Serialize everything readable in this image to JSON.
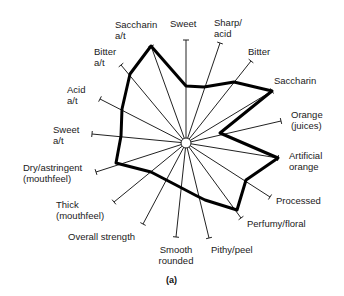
{
  "caption": "(a)",
  "chart_data": {
    "type": "radar",
    "title": "",
    "caption": "(a)",
    "center": [
      186,
      143
    ],
    "axes": [
      {
        "label": "Sweet",
        "angle": 0,
        "tip": [
          186,
          40
        ],
        "value": [
          186,
          86
        ]
      },
      {
        "label": "Sharp/\nacid",
        "angle": 22.5,
        "tip": [
          220,
          43
        ],
        "value": [
          204,
          87
        ]
      },
      {
        "label": "Bitter",
        "angle": 45,
        "tip": [
          251,
          61
        ],
        "value": [
          234,
          82
        ]
      },
      {
        "label": "Saccharin",
        "angle": 63,
        "tip": [
          272,
          91
        ],
        "value": [
          272,
          91
        ]
      },
      {
        "label": "Orange\n(juices)",
        "angle": 78,
        "tip": [
          281,
          121
        ],
        "value": [
          220,
          133
        ]
      },
      {
        "label": "Artificial\norange",
        "angle": 100,
        "tip": [
          278,
          158
        ],
        "value": [
          278,
          158
        ]
      },
      {
        "label": "Processed",
        "angle": 120,
        "tip": [
          270,
          197
        ],
        "value": [
          246,
          180
        ]
      },
      {
        "label": "Perfumy/floral",
        "angle": 145,
        "tip": [
          241,
          218
        ],
        "value": [
          237,
          210
        ]
      },
      {
        "label": "Pithy/peel",
        "angle": 165,
        "tip": [
          209,
          238
        ],
        "value": [
          205,
          200
        ]
      },
      {
        "label": "Smooth\nrounded",
        "angle": 180,
        "tip": [
          176,
          237
        ],
        "value": [
          195,
          195
        ]
      },
      {
        "label": "Overall strength",
        "angle": 200,
        "tip": [
          143,
          224
        ],
        "value": [
          176,
          185
        ]
      },
      {
        "label": "Thick\n(mouthfeel)",
        "angle": 220,
        "tip": [
          114,
          202
        ],
        "value": [
          151,
          172
        ]
      },
      {
        "label": "Dry/astringent\n(mouthfeel)",
        "angle": 245,
        "tip": [
          96,
          172
        ],
        "value": [
          116,
          163
        ]
      },
      {
        "label": "Sweet\na/t",
        "angle": 265,
        "tip": [
          92,
          134
        ],
        "value": [
          121,
          136
        ]
      },
      {
        "label": "Acid\na/t",
        "angle": 285,
        "tip": [
          100,
          99
        ],
        "value": [
          122,
          109
        ]
      },
      {
        "label": "Bitter\na/t",
        "angle": 315,
        "tip": [
          121,
          65
        ],
        "value": [
          130,
          74
        ]
      },
      {
        "label": "Saccharin\na/t",
        "angle": 335,
        "tip": [
          151,
          46
        ],
        "value": [
          151,
          46
        ]
      }
    ],
    "series": [
      {
        "name": "profile",
        "values_note": "vertex positions per axis, listed in axes[].value"
      }
    ],
    "grid": false,
    "legend": "none"
  }
}
